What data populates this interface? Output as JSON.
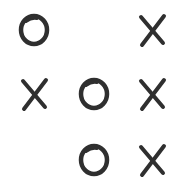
{
  "board": {
    "rows": 3,
    "cols": 3,
    "mark_color": "#2f2f2f",
    "background": "#ffffff",
    "cells": [
      [
        "O",
        "",
        "X"
      ],
      [
        "X",
        "O",
        "X"
      ],
      [
        "",
        "O",
        "X"
      ]
    ]
  }
}
